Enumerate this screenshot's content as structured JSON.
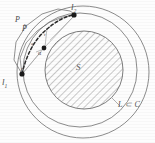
{
  "figure": {
    "labels": {
      "endpoint_start": "l",
      "endpoint_start_sub": "1",
      "endpoint_end": "l",
      "endpoint_end_sub": "2",
      "inner_region": "S",
      "outer_region": "L ⊂ C",
      "path_outer": "P",
      "path_inner": "P̃",
      "vertex_alpha": "α",
      "segment_q": "q",
      "segment_p": "p",
      "segment_t": "t"
    },
    "colors": {
      "stroke": "#6e6e6e",
      "hatch": "#8a8a8a",
      "dashed_curve": "#2b2b2b",
      "point_fill": "#1a1a1a",
      "background": "#fdfdfd",
      "text": "#4a4a4a"
    },
    "geometry": {
      "outer_circle": {
        "cx": 83,
        "cy": 72,
        "r": 66
      },
      "middle_circle": {
        "cx": 80,
        "cy": 70,
        "r": 57
      },
      "inner_hatched_disk": {
        "cx": 84,
        "cy": 70,
        "r": 39
      },
      "point_l1": {
        "x": 22,
        "y": 74
      },
      "point_l2": {
        "x": 74,
        "y": 15
      },
      "point_alpha": {
        "x": 44,
        "y": 48
      }
    }
  }
}
